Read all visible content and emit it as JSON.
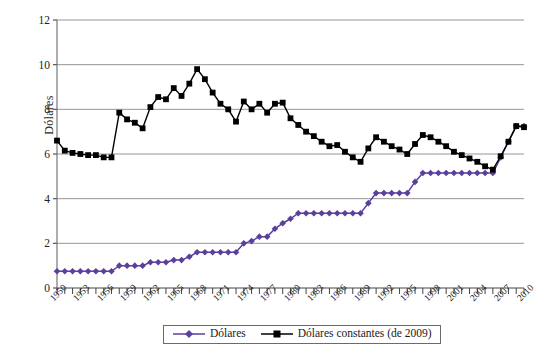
{
  "axis": {
    "y_title": "Dólares",
    "y_ticks": [
      "0",
      "2",
      "4",
      "6",
      "8",
      "10",
      "12"
    ],
    "x_ticks": [
      "1950",
      "1953",
      "1956",
      "1959",
      "1962",
      "1965",
      "1968",
      "1971",
      "1974",
      "1977",
      "1980",
      "1983",
      "1986",
      "1989",
      "1992",
      "1995",
      "1998",
      "2001",
      "2004",
      "2007",
      "2010"
    ]
  },
  "legend": {
    "items": [
      {
        "label": "Dólares",
        "color": "#5b3f9e",
        "marker": "diamond"
      },
      {
        "label": "Dólares constantes (de 2009)",
        "color": "#000000",
        "marker": "square"
      }
    ]
  },
  "chart_data": {
    "type": "line",
    "title": "",
    "xlabel": "",
    "ylabel": "Dólares",
    "ylim": [
      0,
      12
    ],
    "xlim": [
      1950,
      2010
    ],
    "grid": true,
    "legend_position": "bottom",
    "x": [
      1950,
      1951,
      1952,
      1953,
      1954,
      1955,
      1956,
      1957,
      1958,
      1959,
      1960,
      1961,
      1962,
      1963,
      1964,
      1965,
      1966,
      1967,
      1968,
      1969,
      1970,
      1971,
      1972,
      1973,
      1974,
      1975,
      1976,
      1977,
      1978,
      1979,
      1980,
      1981,
      1982,
      1983,
      1984,
      1985,
      1986,
      1987,
      1988,
      1989,
      1990,
      1991,
      1992,
      1993,
      1994,
      1995,
      1996,
      1997,
      1998,
      1999,
      2000,
      2001,
      2002,
      2003,
      2004,
      2005,
      2006,
      2007,
      2008,
      2009,
      2010
    ],
    "series": [
      {
        "name": "Dólares",
        "color": "#5b3f9e",
        "marker": "diamond",
        "values": [
          0.75,
          0.75,
          0.75,
          0.75,
          0.75,
          0.75,
          0.75,
          0.75,
          1.0,
          1.0,
          1.0,
          1.0,
          1.15,
          1.15,
          1.15,
          1.25,
          1.25,
          1.4,
          1.6,
          1.6,
          1.6,
          1.6,
          1.6,
          1.6,
          2.0,
          2.1,
          2.3,
          2.3,
          2.65,
          2.9,
          3.1,
          3.35,
          3.35,
          3.35,
          3.35,
          3.35,
          3.35,
          3.35,
          3.35,
          3.35,
          3.8,
          4.25,
          4.25,
          4.25,
          4.25,
          4.25,
          4.75,
          5.15,
          5.15,
          5.15,
          5.15,
          5.15,
          5.15,
          5.15,
          5.15,
          5.15,
          5.15,
          5.85,
          6.55,
          7.25,
          7.25
        ]
      },
      {
        "name": "Dólares constantes (de 2009)",
        "color": "#000000",
        "marker": "square",
        "values": [
          6.6,
          6.15,
          6.05,
          6.0,
          5.95,
          5.95,
          5.85,
          5.85,
          7.85,
          7.55,
          7.4,
          7.15,
          8.1,
          8.55,
          8.45,
          8.95,
          8.6,
          9.15,
          9.8,
          9.35,
          8.75,
          8.25,
          8.0,
          7.45,
          8.35,
          8.0,
          8.25,
          7.85,
          8.25,
          8.3,
          7.6,
          7.3,
          7.0,
          6.8,
          6.55,
          6.35,
          6.4,
          6.1,
          5.85,
          5.65,
          6.25,
          6.75,
          6.55,
          6.35,
          6.2,
          6.0,
          6.45,
          6.85,
          6.75,
          6.55,
          6.35,
          6.1,
          5.95,
          5.8,
          5.65,
          5.45,
          5.3,
          5.9,
          6.55,
          7.25,
          7.2
        ]
      }
    ]
  }
}
